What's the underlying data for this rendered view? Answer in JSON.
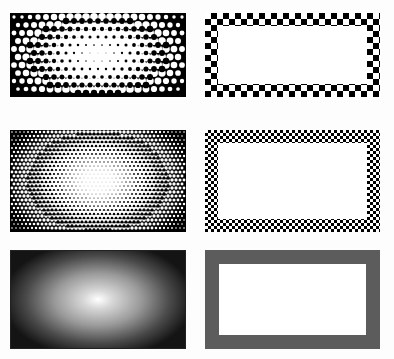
{
  "layout": {
    "rows": 3,
    "columns": 2,
    "description": "Comparison grid: left column shows radial gradient rendered as halftone/dither at decreasing dot sizes; right column shows a rectangular frame border rendered as checkerboard at decreasing cell sizes, then solid gray"
  },
  "panels": [
    {
      "id": "halftone-coarse",
      "row": 1,
      "column": "left",
      "style": "coarse halftone dots radial gradient",
      "dot_spacing_px": 8
    },
    {
      "id": "frame-checker-coarse",
      "row": 1,
      "column": "right",
      "style": "coarse checkerboard frame border",
      "cell_px": 6,
      "border_px": 13
    },
    {
      "id": "halftone-fine",
      "row": 2,
      "column": "left",
      "style": "fine halftone dots radial gradient",
      "dot_spacing_px": 4
    },
    {
      "id": "frame-checker-fine",
      "row": 2,
      "column": "right",
      "style": "fine checkerboard frame border",
      "cell_px": 3,
      "border_px": 13
    },
    {
      "id": "gradient-smooth",
      "row": 3,
      "column": "left",
      "style": "smooth radial gradient white center to black edges"
    },
    {
      "id": "frame-solid-gray",
      "row": 3,
      "column": "right",
      "style": "solid gray frame border",
      "border_px": 14
    }
  ],
  "colors": {
    "background": "#fdfdfd",
    "black": "#000000",
    "white": "#ffffff",
    "frame_gray": "#5c5c5c"
  }
}
